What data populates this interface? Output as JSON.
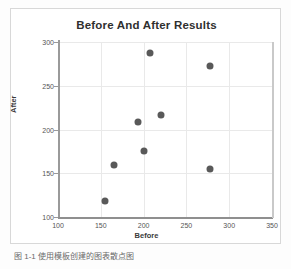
{
  "chart_data": {
    "type": "scatter",
    "title": "Before And After Results",
    "xlabel": "Before",
    "ylabel": "After",
    "xlim": [
      100,
      350
    ],
    "ylim": [
      100,
      300
    ],
    "xticks": [
      100,
      150,
      200,
      250,
      300,
      350
    ],
    "yticks": [
      100,
      150,
      200,
      250,
      300
    ],
    "grid": true,
    "legend": null,
    "marker_color": "#595959",
    "points": [
      {
        "x": 155,
        "y": 118
      },
      {
        "x": 165,
        "y": 160
      },
      {
        "x": 193,
        "y": 209
      },
      {
        "x": 200,
        "y": 176
      },
      {
        "x": 208,
        "y": 288
      },
      {
        "x": 220,
        "y": 217
      },
      {
        "x": 277,
        "y": 273
      },
      {
        "x": 277,
        "y": 155
      }
    ]
  },
  "caption": {
    "text": "图 1-1 使用模板创建的图表散点图"
  }
}
